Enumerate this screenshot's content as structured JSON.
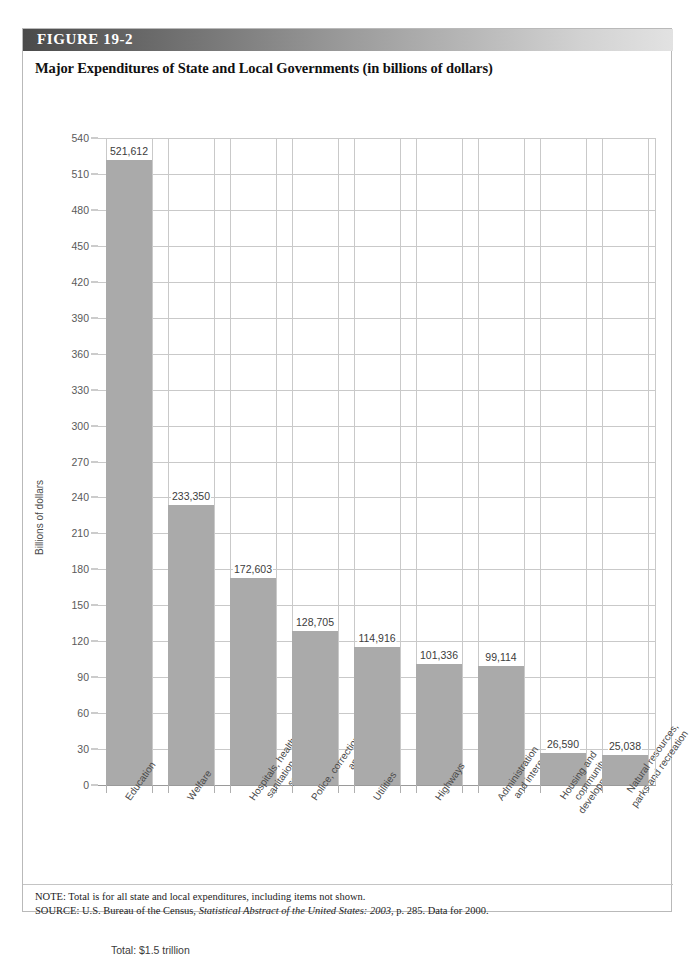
{
  "figure": {
    "number_label": "FIGURE  19-2",
    "title": "Major Expenditures of State and Local Governments (in billions of dollars)",
    "total_note": "Total: $1.5 trillion"
  },
  "notes": {
    "note_label": "NOTE:",
    "note_text": " Total is for all state and local expenditures, including items not shown.",
    "source_label": "SOURCE:",
    "source_pre": " U.S. Bureau of the Census, ",
    "source_italic": "Statistical Abstract of the United States: 2003",
    "source_post": ", p. 285. Data for 2000."
  },
  "colors": {
    "bar_fill": "#aaaaaa",
    "gridline": "#c9c9c9",
    "axis": "#9a9a9a",
    "banner_dark": "#4a4a4a",
    "banner_light": "#e2e2e2"
  },
  "chart_data": {
    "type": "bar",
    "title": "Major Expenditures of State and Local Governments (in billions of dollars)",
    "xlabel": "",
    "ylabel": "Billions of dollars",
    "ylim": [
      0,
      540
    ],
    "ytick_step": 30,
    "yticks": [
      540,
      510,
      480,
      450,
      420,
      390,
      360,
      330,
      300,
      270,
      240,
      210,
      180,
      150,
      120,
      90,
      60,
      30,
      0
    ],
    "grid": true,
    "legend": "none",
    "units": "millions of dollars (labels); axis in billions",
    "categories": [
      "Education",
      "Welfare",
      "Hospitals, health, sanitation, and sewerage",
      "Police, correction, and fire",
      "Utilities",
      "Highways",
      "Administration and interest",
      "Housing and community development",
      "Natural resources, parks and recreation"
    ],
    "category_lines": [
      [
        "Education"
      ],
      [
        "Welfare"
      ],
      [
        "Hospitals, health,",
        "sanitation, and",
        "sewerage"
      ],
      [
        "Police, correction,",
        "and fire"
      ],
      [
        "Utilities"
      ],
      [
        "Highways"
      ],
      [
        "Administration",
        "and interest"
      ],
      [
        "Housing and",
        "community",
        "development"
      ],
      [
        "Natural resources,",
        "parks and recreation"
      ]
    ],
    "values": [
      521.612,
      233.35,
      172.603,
      128.705,
      114.916,
      101.336,
      99.114,
      26.59,
      25.038
    ],
    "value_labels": [
      "521,612",
      "233,350",
      "172,603",
      "128,705",
      "114,916",
      "101,336",
      "99,114",
      "26,590",
      "25,038"
    ],
    "annotations": [
      "Total: $1.5 trillion"
    ]
  }
}
